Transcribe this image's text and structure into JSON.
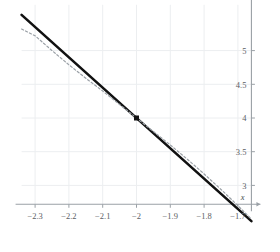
{
  "chart_data": {
    "type": "line",
    "title": "",
    "xlabel": "x",
    "ylabel": "y",
    "grid": true,
    "legend": "none",
    "xlim": [
      -2.34,
      -1.66
    ],
    "ylim": [
      2.72,
      5.68
    ],
    "xticks": [
      "-2.3",
      "-2.2",
      "-2.1",
      "-2",
      "-1.9",
      "-1.8",
      "-1.7"
    ],
    "xtick_values": [
      -2.3,
      -2.2,
      -2.1,
      -2,
      -1.9,
      -1.8,
      -1.7
    ],
    "yticks": [
      "5",
      "4.5",
      "4",
      "3.5",
      "3"
    ],
    "ytick_values": [
      5,
      4.5,
      4,
      3.5,
      3
    ],
    "series": [
      {
        "name": "tangent-line",
        "style": "solid",
        "color": "#111111",
        "width": 2.6,
        "x": [
          -2.34,
          -1.66
        ],
        "y": [
          5.53,
          2.47
        ]
      },
      {
        "name": "curve",
        "style": "dashed",
        "color": "#9aa0a6",
        "width": 1.2,
        "x": [
          -2.34,
          -2.3,
          -2.25,
          -2.2,
          -2.15,
          -2.1,
          -2.05,
          -2,
          -1.95,
          -1.9,
          -1.85,
          -1.8,
          -1.75,
          -1.7,
          -1.66
        ],
        "y": [
          5.32,
          5.22,
          5.0,
          4.79,
          4.59,
          4.4,
          4.2,
          4.0,
          3.8,
          3.6,
          3.39,
          3.17,
          2.94,
          2.7,
          2.5
        ]
      }
    ],
    "points": [
      {
        "name": "tangency-point",
        "x": -2,
        "y": 4,
        "marker": "square",
        "color": "#111111",
        "size": 5
      }
    ],
    "annotations": []
  },
  "axes": {
    "y_axis_label": "y",
    "x_axis_label": "x",
    "y_axis_position": "right",
    "x_axis_position": "bottom"
  },
  "colors": {
    "grid": "#eceef0",
    "axis": "#9aa0a6",
    "line": "#111111",
    "curve": "#9aa0a6",
    "text": "#5b6064",
    "background": "#ffffff"
  }
}
